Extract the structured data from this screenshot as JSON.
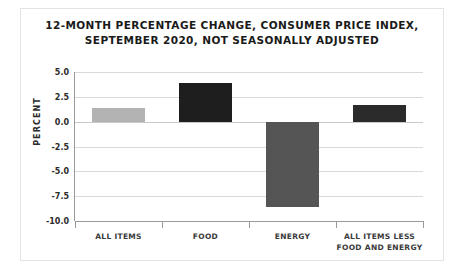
{
  "chart_data": {
    "type": "bar",
    "title": "12-MONTH PERCENTAGE CHANGE, CONSUMER PRICE INDEX, SEPTEMBER 2020, NOT SEASONALLY ADJUSTED",
    "title_lines": [
      "12-MONTH PERCENTAGE CHANGE, CONSUMER PRICE INDEX,",
      "SEPTEMBER 2020, NOT SEASONALLY ADJUSTED"
    ],
    "xlabel": "",
    "ylabel": "PERCENT",
    "categories": [
      "ALL ITEMS",
      "FOOD",
      "ENERGY",
      "ALL ITEMS LESS FOOD AND ENERGY"
    ],
    "category_lines": [
      [
        "ALL ITEMS"
      ],
      [
        "FOOD"
      ],
      [
        "ENERGY"
      ],
      [
        "ALL ITEMS LESS",
        "FOOD AND ENERGY"
      ]
    ],
    "values": [
      1.4,
      3.9,
      -8.6,
      1.7
    ],
    "bar_colors": [
      "#b3b3b3",
      "#1e1e1e",
      "#555555",
      "#2b2b2b"
    ],
    "ylim": [
      -10.0,
      5.0
    ],
    "yticks": [
      5.0,
      2.5,
      0.0,
      -2.5,
      -5.0,
      -7.5,
      -10.0
    ],
    "ytick_labels": [
      "5.0",
      "2.5",
      "0.0",
      "-2.5",
      "-5.0",
      "-7.5",
      "-10.0"
    ],
    "grid": true,
    "legend": "none"
  },
  "figure": {
    "border_color": "#e3e3e3",
    "background": "#ffffff",
    "gridline_color": "#d9d9d9",
    "axis_color": "#9a9a9a"
  }
}
